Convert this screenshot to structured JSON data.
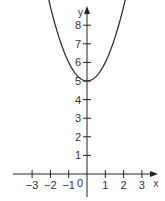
{
  "chart_data": {
    "type": "line",
    "title": "",
    "function": "y = x^2 + 5",
    "xlabel": "x",
    "ylabel": "y",
    "origin_label": "0",
    "x_ticks": [
      -3,
      -2,
      -1,
      1,
      2,
      3
    ],
    "x_tick_labels": [
      "−3",
      "−2",
      "−1",
      "1",
      "2",
      "3"
    ],
    "y_ticks": [
      1,
      2,
      3,
      4,
      5,
      6,
      7,
      8
    ],
    "y_tick_labels": [
      "1",
      "2",
      "3",
      "4",
      "5",
      "6",
      "7",
      "8"
    ],
    "xlim": [
      -4.0,
      3.8
    ],
    "ylim": [
      -1.2,
      9.4
    ],
    "grid": false,
    "legend": null,
    "series": [
      {
        "name": "parabola",
        "x": [
          -2.0,
          -1.5,
          -1.0,
          -0.5,
          0,
          0.5,
          1.0,
          1.5,
          2.0
        ],
        "values": [
          9.0,
          7.25,
          6.0,
          5.25,
          5.0,
          5.25,
          6.0,
          7.25,
          9.0
        ]
      }
    ],
    "vertex": [
      0,
      5
    ],
    "colors": {
      "axis": "#222222",
      "curve": "#333333",
      "text": "#333333"
    }
  }
}
